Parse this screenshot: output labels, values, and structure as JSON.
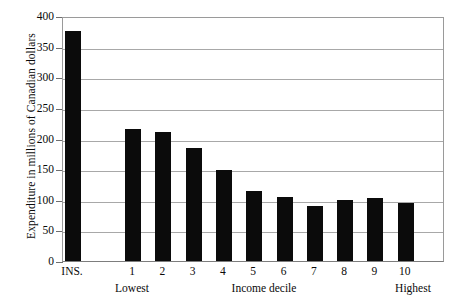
{
  "chart_data": {
    "type": "bar",
    "title": "",
    "xlabel": "Income decile",
    "ylabel": "Expenditure in millions of Canadian dollars",
    "categories": [
      "INS.",
      "1",
      "2",
      "3",
      "4",
      "5",
      "6",
      "7",
      "8",
      "9",
      "10"
    ],
    "values": [
      376,
      215,
      211,
      185,
      148,
      114,
      105,
      90,
      99,
      103,
      94
    ],
    "ylim": [
      0,
      400
    ],
    "ytick_values": [
      0,
      50,
      100,
      150,
      200,
      250,
      300,
      350,
      400
    ],
    "ytick_labels": [
      "0",
      "50",
      "100",
      "150",
      "200",
      "250",
      "300",
      "350",
      "400"
    ],
    "grid": true,
    "legend": false,
    "bar_color": "#0b0b0b",
    "axis_color": "#9a9a9a",
    "gridline_color": "#a8a8a8",
    "annotations": {
      "lowest": "Lowest",
      "highest": "Highest"
    }
  },
  "axes": {
    "y_title": "Expenditure in millions of Canadian dollars",
    "x_title": "Income decile",
    "x_low_label": "Lowest",
    "x_high_label": "Highest"
  }
}
